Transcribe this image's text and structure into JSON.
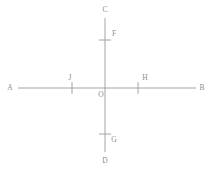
{
  "figure": {
    "kind": "geometry-diagram",
    "canvas": {
      "width": 212,
      "height": 174,
      "background": "#ffffff"
    },
    "style": {
      "line_color": "#9a9a9a",
      "tick_color": "#9a9a9a",
      "label_color": "#8d8d8d",
      "line_width": 0.9,
      "tick_width": 0.9,
      "label_font_size": 7.5
    },
    "lines": [
      {
        "name": "horizontal-line-AB",
        "from_label": "A",
        "to_label": "B",
        "x1": 18,
        "y1": 88,
        "x2": 196,
        "y2": 88
      },
      {
        "name": "vertical-line-CD",
        "from_label": "C",
        "to_label": "D",
        "x1": 105,
        "y1": 18,
        "x2": 105,
        "y2": 152
      }
    ],
    "ticks": [
      {
        "name": "tick-F",
        "orientation": "horizontal",
        "x1": 99,
        "y1": 40,
        "x2": 111,
        "y2": 40
      },
      {
        "name": "tick-G",
        "orientation": "horizontal",
        "x1": 99,
        "y1": 134,
        "x2": 111,
        "y2": 134
      },
      {
        "name": "tick-J",
        "orientation": "vertical",
        "x1": 72,
        "y1": 82,
        "x2": 72,
        "y2": 94
      },
      {
        "name": "tick-H",
        "orientation": "vertical",
        "x1": 138,
        "y1": 82,
        "x2": 138,
        "y2": 94
      }
    ],
    "labels": [
      {
        "name": "label-C",
        "text": "C",
        "x": 105,
        "y": 10
      },
      {
        "name": "label-F",
        "text": "F",
        "x": 114,
        "y": 34
      },
      {
        "name": "label-A",
        "text": "A",
        "x": 10,
        "y": 88
      },
      {
        "name": "label-J",
        "text": "J",
        "x": 70,
        "y": 78
      },
      {
        "name": "label-O",
        "text": "O",
        "x": 101,
        "y": 95
      },
      {
        "name": "label-H",
        "text": "H",
        "x": 145,
        "y": 78
      },
      {
        "name": "label-B",
        "text": "B",
        "x": 202,
        "y": 88
      },
      {
        "name": "label-G",
        "text": "G",
        "x": 114,
        "y": 140
      },
      {
        "name": "label-D",
        "text": "D",
        "x": 105,
        "y": 161
      }
    ]
  }
}
